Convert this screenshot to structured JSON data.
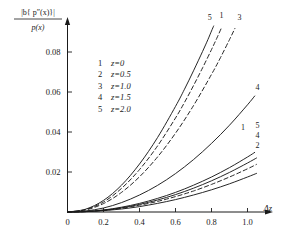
{
  "chart_data": {
    "type": "line",
    "title": "",
    "xlabel": "Δz",
    "ylabel_numerator": "|b{ p″(x)}|",
    "ylabel_denominator": "p(x)",
    "xlim": [
      0,
      1.15
    ],
    "ylim": [
      0,
      0.097
    ],
    "xticks": [
      0,
      0.2,
      0.4,
      0.6,
      0.8,
      1.0
    ],
    "xticklabels": [
      "0",
      "0.2",
      "0.4",
      "0.6",
      "0.8",
      "1.0"
    ],
    "yticks": [
      0.02,
      0.04,
      0.06,
      0.08
    ],
    "yticklabels": [
      "0.02",
      "0.04",
      "0.06",
      "0.08"
    ],
    "grid": false,
    "legend_position": "upper-left-inside",
    "legend": [
      {
        "key": "1",
        "label": "z=0"
      },
      {
        "key": "2",
        "label": "z=0.5"
      },
      {
        "key": "3",
        "label": "z=1.0"
      },
      {
        "key": "4",
        "label": "z=1.5"
      },
      {
        "key": "5",
        "label": "z=2.0"
      }
    ],
    "series": [
      {
        "name": "1",
        "legend_label": "z=0",
        "style": "dashed",
        "end_label": "1",
        "points": [
          [
            0,
            0
          ],
          [
            0.1,
            0.0012
          ],
          [
            0.2,
            0.005
          ],
          [
            0.3,
            0.0118
          ],
          [
            0.4,
            0.0212
          ],
          [
            0.5,
            0.033
          ],
          [
            0.6,
            0.047
          ],
          [
            0.65,
            0.0548
          ],
          [
            0.7,
            0.0632
          ],
          [
            0.75,
            0.072
          ],
          [
            0.8,
            0.0812
          ],
          [
            0.83,
            0.087
          ],
          [
            0.855,
            0.092
          ]
        ]
      },
      {
        "name": "5",
        "legend_label": "z=2.0",
        "style": "solid",
        "end_label": "5",
        "points": [
          [
            0,
            0
          ],
          [
            0.1,
            0.0014
          ],
          [
            0.2,
            0.0058
          ],
          [
            0.3,
            0.0134
          ],
          [
            0.4,
            0.024
          ],
          [
            0.5,
            0.0372
          ],
          [
            0.6,
            0.0528
          ],
          [
            0.65,
            0.0614
          ],
          [
            0.7,
            0.0706
          ],
          [
            0.75,
            0.0802
          ],
          [
            0.78,
            0.0862
          ],
          [
            0.8,
            0.0905
          ],
          [
            0.812,
            0.093
          ]
        ]
      },
      {
        "name": "3",
        "legend_label": "z=1.0",
        "style": "dashed",
        "end_label": "3",
        "points": [
          [
            0,
            0
          ],
          [
            0.1,
            0.001
          ],
          [
            0.2,
            0.0042
          ],
          [
            0.3,
            0.0098
          ],
          [
            0.4,
            0.0176
          ],
          [
            0.5,
            0.0275
          ],
          [
            0.6,
            0.0394
          ],
          [
            0.7,
            0.0532
          ],
          [
            0.8,
            0.0688
          ],
          [
            0.85,
            0.0772
          ],
          [
            0.9,
            0.0862
          ],
          [
            0.93,
            0.0918
          ]
        ]
      },
      {
        "name": "4",
        "legend_label": "z=1.5",
        "style": "solid",
        "end_label": "4",
        "points": [
          [
            0,
            0
          ],
          [
            0.1,
            0.0005
          ],
          [
            0.2,
            0.002
          ],
          [
            0.3,
            0.0047
          ],
          [
            0.4,
            0.0085
          ],
          [
            0.5,
            0.0133
          ],
          [
            0.6,
            0.0192
          ],
          [
            0.7,
            0.0262
          ],
          [
            0.8,
            0.0343
          ],
          [
            0.9,
            0.0434
          ],
          [
            1.0,
            0.0536
          ],
          [
            1.04,
            0.058
          ]
        ]
      },
      {
        "name": "1b",
        "legend_label": "z=0",
        "style": "solid",
        "end_label": "1",
        "points": [
          [
            0,
            0
          ],
          [
            0.1,
            0.00025
          ],
          [
            0.2,
            0.001
          ],
          [
            0.3,
            0.0024
          ],
          [
            0.4,
            0.0043
          ],
          [
            0.5,
            0.0068
          ],
          [
            0.6,
            0.0098
          ],
          [
            0.7,
            0.0134
          ],
          [
            0.8,
            0.0175
          ],
          [
            0.9,
            0.0222
          ],
          [
            1.0,
            0.0275
          ],
          [
            1.04,
            0.0298
          ]
        ]
      },
      {
        "name": "5b",
        "legend_label": "z=2.0",
        "style": "solid",
        "end_label": "5",
        "points": [
          [
            0,
            0
          ],
          [
            0.1,
            0.00022
          ],
          [
            0.2,
            0.0009
          ],
          [
            0.3,
            0.0021
          ],
          [
            0.4,
            0.0038
          ],
          [
            0.5,
            0.006
          ],
          [
            0.6,
            0.0087
          ],
          [
            0.7,
            0.0119
          ],
          [
            0.8,
            0.0156
          ],
          [
            0.9,
            0.0198
          ],
          [
            1.0,
            0.0245
          ],
          [
            1.05,
            0.027
          ]
        ]
      },
      {
        "name": "4b",
        "legend_label": "z=1.5",
        "style": "dashed",
        "end_label": "4",
        "points": [
          [
            0,
            0
          ],
          [
            0.1,
            0.0002
          ],
          [
            0.2,
            0.0008
          ],
          [
            0.3,
            0.0019
          ],
          [
            0.4,
            0.0034
          ],
          [
            0.5,
            0.0053
          ],
          [
            0.6,
            0.0077
          ],
          [
            0.7,
            0.0105
          ],
          [
            0.8,
            0.0138
          ],
          [
            0.9,
            0.0175
          ],
          [
            1.0,
            0.0216
          ],
          [
            1.05,
            0.0238
          ]
        ]
      },
      {
        "name": "2",
        "legend_label": "z=0.5",
        "style": "solid",
        "end_label": "2",
        "points": [
          [
            0,
            0
          ],
          [
            0.1,
            0.00016
          ],
          [
            0.2,
            0.00065
          ],
          [
            0.3,
            0.0015
          ],
          [
            0.4,
            0.0027
          ],
          [
            0.5,
            0.0043
          ],
          [
            0.6,
            0.0062
          ],
          [
            0.7,
            0.0085
          ],
          [
            0.8,
            0.0111
          ],
          [
            0.9,
            0.0141
          ],
          [
            1.0,
            0.0175
          ],
          [
            1.05,
            0.0193
          ]
        ]
      }
    ],
    "curve_end_labels": [
      {
        "text": "5",
        "x": 0.79,
        "y": 0.096
      },
      {
        "text": "1",
        "x": 0.855,
        "y": 0.0968
      },
      {
        "text": "3",
        "x": 0.955,
        "y": 0.096
      },
      {
        "text": "4",
        "x": 1.055,
        "y": 0.0612
      },
      {
        "text": "1",
        "x": 0.975,
        "y": 0.0408
      },
      {
        "text": "5",
        "x": 1.055,
        "y": 0.0418
      },
      {
        "text": "4",
        "x": 1.055,
        "y": 0.0368
      },
      {
        "text": "2",
        "x": 1.055,
        "y": 0.0322
      }
    ],
    "colors": {
      "axis": "#1a1a1a",
      "curve": "#1a1a1a",
      "background": "#ffffff"
    }
  }
}
